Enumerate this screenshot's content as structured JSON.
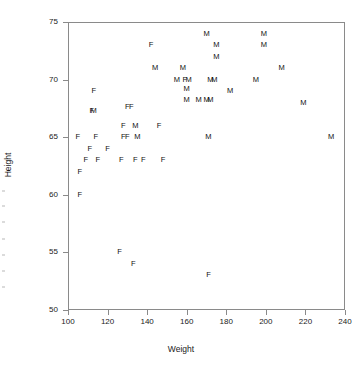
{
  "chart_data": {
    "type": "scatter",
    "title": "",
    "xlabel": "Weight",
    "ylabel": "Height",
    "xlim": [
      100,
      240
    ],
    "ylim": [
      50,
      75
    ],
    "xticks": [
      100,
      120,
      140,
      160,
      180,
      200,
      220,
      240
    ],
    "yticks": [
      50,
      55,
      60,
      65,
      70,
      75
    ],
    "grid": false,
    "legend": "none",
    "marker_style": "text-label",
    "series": [
      {
        "name": "F",
        "marker": "F",
        "points": [
          {
            "x": 105,
            "y": 65
          },
          {
            "x": 106,
            "y": 62
          },
          {
            "x": 106,
            "y": 60
          },
          {
            "x": 109,
            "y": 63
          },
          {
            "x": 111,
            "y": 64
          },
          {
            "x": 112,
            "y": 67.3
          },
          {
            "x": 113,
            "y": 69
          },
          {
            "x": 114,
            "y": 65
          },
          {
            "x": 115,
            "y": 63
          },
          {
            "x": 120,
            "y": 64
          },
          {
            "x": 126,
            "y": 55
          },
          {
            "x": 127,
            "y": 63
          },
          {
            "x": 128,
            "y": 66
          },
          {
            "x": 128,
            "y": 65
          },
          {
            "x": 130,
            "y": 65
          },
          {
            "x": 130,
            "y": 67.6
          },
          {
            "x": 132,
            "y": 67.6
          },
          {
            "x": 133,
            "y": 54
          },
          {
            "x": 134,
            "y": 63
          },
          {
            "x": 138,
            "y": 63
          },
          {
            "x": 142,
            "y": 73
          },
          {
            "x": 146,
            "y": 66
          },
          {
            "x": 148,
            "y": 63
          },
          {
            "x": 159,
            "y": 70
          },
          {
            "x": 171,
            "y": 53
          }
        ]
      },
      {
        "name": "M",
        "marker": "M",
        "points": [
          {
            "x": 113,
            "y": 67.3
          },
          {
            "x": 134,
            "y": 66
          },
          {
            "x": 135,
            "y": 65
          },
          {
            "x": 144,
            "y": 71
          },
          {
            "x": 155,
            "y": 70
          },
          {
            "x": 158,
            "y": 71
          },
          {
            "x": 161,
            "y": 70
          },
          {
            "x": 160,
            "y": 68.2
          },
          {
            "x": 160,
            "y": 69.2
          },
          {
            "x": 166,
            "y": 68.2
          },
          {
            "x": 170,
            "y": 74
          },
          {
            "x": 170,
            "y": 68.2
          },
          {
            "x": 172,
            "y": 68.2
          },
          {
            "x": 172,
            "y": 70
          },
          {
            "x": 174,
            "y": 70
          },
          {
            "x": 171,
            "y": 65
          },
          {
            "x": 175,
            "y": 73
          },
          {
            "x": 175,
            "y": 72
          },
          {
            "x": 182,
            "y": 69
          },
          {
            "x": 195,
            "y": 70
          },
          {
            "x": 199,
            "y": 74
          },
          {
            "x": 199,
            "y": 73
          },
          {
            "x": 208,
            "y": 71
          },
          {
            "x": 219,
            "y": 68
          },
          {
            "x": 233,
            "y": 65
          }
        ]
      }
    ]
  }
}
